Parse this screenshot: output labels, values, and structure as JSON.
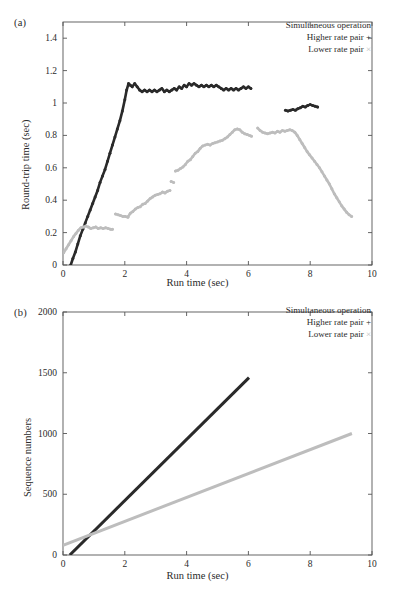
{
  "figure": {
    "panels": [
      {
        "id": "a",
        "label": "(a)",
        "legend": {
          "title": "Simultaneous operation",
          "entries": [
            {
              "label": "Higher rate pair",
              "marker": "+",
              "color": "#2a2a2a"
            },
            {
              "label": "Lower rate pair",
              "marker": "×",
              "color": "#bdbdbd"
            }
          ]
        }
      },
      {
        "id": "b",
        "label": "(b)",
        "legend": {
          "title": "Simultaneous operation",
          "entries": [
            {
              "label": "Higher rate pair",
              "marker": "+",
              "color": "#2a2a2a"
            },
            {
              "label": "Lower rate pair",
              "marker": "×",
              "color": "#bdbdbd"
            }
          ]
        }
      }
    ]
  },
  "chart_data": [
    {
      "panel": "a",
      "type": "scatter",
      "title": "",
      "xlabel": "Run time (sec)",
      "ylabel": "Round-trip time (sec)",
      "xlim": [
        0,
        10
      ],
      "ylim": [
        0,
        1.5
      ],
      "xticks": [
        0,
        2,
        4,
        6,
        8,
        10
      ],
      "xticklabels": [
        "0",
        "2",
        "4",
        "6",
        "8",
        "10"
      ],
      "yticks": [
        0,
        0.2,
        0.4,
        0.6,
        0.8,
        1,
        1.2,
        1.4
      ],
      "yticklabels": [
        "0",
        "0.2",
        "0.4",
        "0.6",
        "0.8",
        "1",
        "1.2",
        "1.4"
      ],
      "grid": false,
      "legend_position": "top-right",
      "series": [
        {
          "name": "Higher rate pair",
          "marker": "+",
          "color": "#2a2a2a",
          "segments": [
            {
              "x": [
                0.25,
                0.32,
                0.4,
                0.48,
                0.56,
                0.64,
                0.72,
                0.8,
                0.88,
                0.96,
                1.04,
                1.12,
                1.2,
                1.28,
                1.36,
                1.44,
                1.52,
                1.6,
                1.68,
                1.76,
                1.84,
                1.92,
                2.0,
                2.06,
                2.12,
                2.18,
                2.24,
                2.32,
                2.4,
                2.48,
                2.56,
                2.64,
                2.72,
                2.8,
                2.88,
                2.96,
                3.04,
                3.12,
                3.2,
                3.28,
                3.36,
                3.44,
                3.52,
                3.6,
                3.68,
                3.76,
                3.84,
                3.92,
                4.0,
                4.08,
                4.16,
                4.24,
                4.32,
                4.4,
                4.48,
                4.56,
                4.64,
                4.72,
                4.8,
                4.88,
                4.96,
                5.04,
                5.12,
                5.2,
                5.28,
                5.36,
                5.44,
                5.52,
                5.6,
                5.68,
                5.76,
                5.84,
                5.92,
                6.0,
                6.08
              ],
              "y": [
                0.0,
                0.04,
                0.08,
                0.13,
                0.18,
                0.22,
                0.26,
                0.3,
                0.34,
                0.38,
                0.42,
                0.46,
                0.51,
                0.55,
                0.59,
                0.64,
                0.69,
                0.74,
                0.79,
                0.84,
                0.89,
                0.95,
                1.02,
                1.08,
                1.12,
                1.11,
                1.1,
                1.12,
                1.1,
                1.08,
                1.07,
                1.08,
                1.07,
                1.08,
                1.07,
                1.08,
                1.07,
                1.08,
                1.09,
                1.07,
                1.08,
                1.07,
                1.08,
                1.09,
                1.08,
                1.1,
                1.09,
                1.11,
                1.1,
                1.12,
                1.11,
                1.12,
                1.11,
                1.1,
                1.11,
                1.1,
                1.11,
                1.1,
                1.11,
                1.1,
                1.11,
                1.1,
                1.09,
                1.08,
                1.09,
                1.08,
                1.09,
                1.08,
                1.09,
                1.08,
                1.09,
                1.1,
                1.09,
                1.1,
                1.09
              ]
            },
            {
              "x": [
                7.2,
                7.28,
                7.36,
                7.44,
                7.52,
                7.6,
                7.68,
                7.76,
                7.84,
                7.92,
                8.0,
                8.08,
                8.16,
                8.24
              ],
              "y": [
                0.955,
                0.95,
                0.955,
                0.96,
                0.955,
                0.965,
                0.97,
                0.98,
                0.975,
                0.985,
                0.99,
                0.985,
                0.98,
                0.975
              ]
            }
          ]
        },
        {
          "name": "Lower rate pair",
          "marker": "×",
          "color": "#bdbdbd",
          "segments": [
            {
              "x": [
                0.02,
                0.1,
                0.18,
                0.26,
                0.34,
                0.42,
                0.5,
                0.58,
                0.66,
                0.74,
                0.82,
                0.9,
                0.98,
                1.06,
                1.14,
                1.22,
                1.3,
                1.38,
                1.46,
                1.54,
                1.6
              ],
              "y": [
                0.075,
                0.1,
                0.125,
                0.15,
                0.175,
                0.195,
                0.215,
                0.23,
                0.235,
                0.24,
                0.235,
                0.225,
                0.23,
                0.235,
                0.225,
                0.23,
                0.225,
                0.23,
                0.225,
                0.22,
                0.22
              ]
            },
            {
              "x": [
                1.7,
                1.78,
                1.86,
                1.94,
                2.02,
                2.1,
                2.18,
                2.26,
                2.34,
                2.42,
                2.5,
                2.58,
                2.66,
                2.74,
                2.82,
                2.9,
                2.98,
                3.06,
                3.14,
                3.22,
                3.3,
                3.38,
                3.46
              ],
              "y": [
                0.315,
                0.31,
                0.305,
                0.3,
                0.3,
                0.295,
                0.32,
                0.33,
                0.345,
                0.355,
                0.36,
                0.375,
                0.38,
                0.395,
                0.41,
                0.42,
                0.43,
                0.435,
                0.44,
                0.45,
                0.445,
                0.455,
                0.46
              ]
            },
            {
              "x": [
                3.5,
                3.58
              ],
              "y": [
                0.515,
                0.51
              ]
            },
            {
              "x": [
                3.64,
                3.72,
                3.8,
                3.88,
                3.96,
                4.04,
                4.12,
                4.2,
                4.28,
                4.36,
                4.44,
                4.52,
                4.6,
                4.68,
                4.76,
                4.84,
                4.92,
                5.0,
                5.08,
                5.16,
                5.24,
                5.32,
                5.4,
                5.48,
                5.56,
                5.64,
                5.72,
                5.8,
                5.88,
                5.96,
                6.04,
                6.1
              ],
              "y": [
                0.58,
                0.585,
                0.595,
                0.605,
                0.62,
                0.64,
                0.65,
                0.67,
                0.69,
                0.7,
                0.72,
                0.735,
                0.74,
                0.745,
                0.74,
                0.75,
                0.755,
                0.76,
                0.765,
                0.77,
                0.78,
                0.79,
                0.805,
                0.82,
                0.835,
                0.84,
                0.835,
                0.82,
                0.81,
                0.805,
                0.8,
                0.795
              ]
            },
            {
              "x": [
                6.3,
                6.38,
                6.46,
                6.54,
                6.62,
                6.7,
                6.78,
                6.86,
                6.94,
                7.02,
                7.1,
                7.18,
                7.26,
                7.34,
                7.42,
                7.5,
                7.58,
                7.66,
                7.74,
                7.82,
                7.9,
                7.98,
                8.06,
                8.14,
                8.22,
                8.3,
                8.38,
                8.46,
                8.54,
                8.62,
                8.7,
                8.78,
                8.86,
                8.94,
                9.02,
                9.1,
                9.18,
                9.26,
                9.34
              ],
              "y": [
                0.845,
                0.83,
                0.82,
                0.815,
                0.81,
                0.815,
                0.82,
                0.815,
                0.825,
                0.82,
                0.83,
                0.825,
                0.83,
                0.835,
                0.83,
                0.82,
                0.8,
                0.775,
                0.75,
                0.725,
                0.7,
                0.68,
                0.66,
                0.64,
                0.62,
                0.6,
                0.575,
                0.55,
                0.525,
                0.5,
                0.47,
                0.44,
                0.415,
                0.39,
                0.365,
                0.345,
                0.325,
                0.31,
                0.3
              ]
            }
          ]
        }
      ]
    },
    {
      "panel": "b",
      "type": "line",
      "title": "",
      "xlabel": "Run time (sec)",
      "ylabel": "Sequence numbers",
      "xlim": [
        0,
        10
      ],
      "ylim": [
        0,
        2000
      ],
      "xticks": [
        0,
        2,
        4,
        6,
        8,
        10
      ],
      "xticklabels": [
        "0",
        "2",
        "4",
        "6",
        "8",
        "10"
      ],
      "yticks": [
        0,
        500,
        1000,
        1500,
        2000
      ],
      "yticklabels": [
        "0",
        "500",
        "1000",
        "1500",
        "2000"
      ],
      "grid": false,
      "legend_position": "top-right",
      "series": [
        {
          "name": "Higher rate pair",
          "marker": "+",
          "color": "#2a2a2a",
          "x": [
            0.22,
            6.02
          ],
          "y": [
            0,
            1460
          ]
        },
        {
          "name": "Lower rate pair",
          "marker": "×",
          "color": "#bdbdbd",
          "x": [
            0.0,
            9.35
          ],
          "y": [
            80,
            1000
          ]
        }
      ]
    }
  ]
}
